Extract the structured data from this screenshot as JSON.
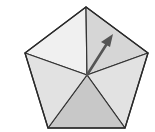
{
  "diagram": {
    "type": "spinner",
    "shape": "pentagon",
    "section_count": 5,
    "center": [
      87,
      75
    ],
    "vertices": {
      "top": [
        86,
        7
      ],
      "right": [
        148,
        53
      ],
      "bottom_right": [
        125,
        128
      ],
      "bottom_left": [
        48,
        128
      ],
      "left": [
        25,
        53
      ]
    },
    "sections": [
      {
        "id": "top-left",
        "fill": "#f0f0f0"
      },
      {
        "id": "top-right",
        "fill": "#d6d6d6"
      },
      {
        "id": "right",
        "fill": "#e2e2e2"
      },
      {
        "id": "bottom",
        "fill": "#c8c8c8"
      },
      {
        "id": "left",
        "fill": "#e2e2e2"
      }
    ],
    "arrow": {
      "from": [
        87,
        75
      ],
      "to": [
        113,
        34
      ],
      "color": "#555555",
      "points_to_section": "top-right"
    },
    "stroke_color": "#333333"
  }
}
